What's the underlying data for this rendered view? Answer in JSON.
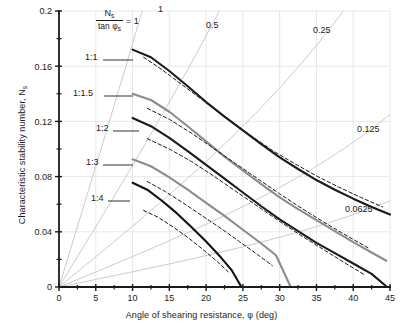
{
  "chart_data": {
    "type": "line",
    "title": "",
    "xlabel": "Angle of shearing resistance, φ (deg)",
    "ylabel": "Characteristic stability number, N",
    "ylabel_sub": "s",
    "xlim": [
      0,
      45
    ],
    "ylim": [
      0,
      0.2
    ],
    "grid": true,
    "x_ticks": [
      0,
      5,
      10,
      15,
      20,
      25,
      30,
      35,
      40,
      45
    ],
    "x_tick_labels": [
      "0",
      "5",
      "10",
      "15",
      "20",
      "25",
      "30",
      "35",
      "40",
      "45"
    ],
    "x_minor_step": 2.5,
    "y_ticks": [
      0,
      0.04,
      0.08,
      0.12,
      0.16,
      0.2
    ],
    "y_tick_labels": [
      "0",
      "0.04",
      "0.08",
      "0.12",
      "0.16",
      "0.2"
    ],
    "y_minor_step": 0.02,
    "legend_position": "inline-labels",
    "annotation_fraction": {
      "numerator": "N",
      "numerator_sub": "s",
      "denominator": "tan φ",
      "denominator_sub": "s",
      "equals": "= 1"
    },
    "rays": [
      {
        "label": "1",
        "value": 1,
        "slope_ratio": 1,
        "label_x": 158,
        "label_y": 12
      },
      {
        "label": "0.5",
        "value": 0.5,
        "slope_ratio": 0.5,
        "label_x": 206,
        "label_y": 28
      },
      {
        "label": "0.25",
        "value": 0.25,
        "slope_ratio": 0.25,
        "label_x": 313,
        "label_y": 33
      },
      {
        "label": "0.125",
        "value": 0.125,
        "slope_ratio": 0.125,
        "label_x": 357,
        "label_y": 132
      },
      {
        "label": "0.0625",
        "value": 0.0625,
        "slope_ratio": 0.0625,
        "label_x": 345,
        "label_y": 212
      }
    ],
    "series": [
      {
        "name": "1:1",
        "label": "1:1",
        "style": "solid-dark",
        "color": "#1a1a1a",
        "label_x": 85,
        "label_y": 56,
        "leader_from_x": 103,
        "leader_to_x": 133,
        "leader_y": 60,
        "points": [
          {
            "x": 10,
            "y": 0.172
          },
          {
            "x": 12.5,
            "y": 0.1665
          },
          {
            "x": 15,
            "y": 0.1565
          },
          {
            "x": 17.5,
            "y": 0.1455
          },
          {
            "x": 20,
            "y": 0.134
          },
          {
            "x": 22.5,
            "y": 0.1235
          },
          {
            "x": 25,
            "y": 0.1135
          },
          {
            "x": 27.5,
            "y": 0.1035
          },
          {
            "x": 30,
            "y": 0.094
          },
          {
            "x": 32.5,
            "y": 0.0855
          },
          {
            "x": 35,
            "y": 0.0775
          },
          {
            "x": 37.5,
            "y": 0.0705
          },
          {
            "x": 40,
            "y": 0.064
          },
          {
            "x": 42.5,
            "y": 0.058
          },
          {
            "x": 45,
            "y": 0.0525
          }
        ]
      },
      {
        "name": "1:1 dashed",
        "label": "",
        "style": "dashed-dark",
        "color": "#1a1a1a",
        "points": [
          {
            "x": 11.5,
            "y": 0.1665
          },
          {
            "x": 14,
            "y": 0.1575
          },
          {
            "x": 17,
            "y": 0.1455
          },
          {
            "x": 20,
            "y": 0.1335
          },
          {
            "x": 23,
            "y": 0.1215
          },
          {
            "x": 26,
            "y": 0.11
          },
          {
            "x": 29,
            "y": 0.099
          },
          {
            "x": 32,
            "y": 0.0895
          },
          {
            "x": 35,
            "y": 0.0805
          },
          {
            "x": 38,
            "y": 0.0725
          },
          {
            "x": 41,
            "y": 0.065
          },
          {
            "x": 44,
            "y": 0.058
          }
        ]
      },
      {
        "name": "1:1.5",
        "label": "1:1.5",
        "style": "solid-gray",
        "color": "#8c8c8c",
        "label_x": 73,
        "label_y": 92,
        "leader_from_x": 104,
        "leader_to_x": 133,
        "leader_y": 96,
        "points": [
          {
            "x": 10,
            "y": 0.14
          },
          {
            "x": 12.5,
            "y": 0.1355
          },
          {
            "x": 15,
            "y": 0.127
          },
          {
            "x": 17.5,
            "y": 0.1165
          },
          {
            "x": 20,
            "y": 0.1055
          },
          {
            "x": 22.5,
            "y": 0.0945
          },
          {
            "x": 25,
            "y": 0.0845
          },
          {
            "x": 27.5,
            "y": 0.0745
          },
          {
            "x": 30,
            "y": 0.065
          },
          {
            "x": 32.5,
            "y": 0.0565
          },
          {
            "x": 35,
            "y": 0.0485
          },
          {
            "x": 37.5,
            "y": 0.0405
          },
          {
            "x": 40,
            "y": 0.0325
          },
          {
            "x": 42.5,
            "y": 0.025
          },
          {
            "x": 44.5,
            "y": 0.019
          }
        ]
      },
      {
        "name": "1:1.5 dashed",
        "label": "",
        "style": "dashed-dark",
        "color": "#1a1a1a",
        "points": [
          {
            "x": 12,
            "y": 0.1295
          },
          {
            "x": 15,
            "y": 0.1215
          },
          {
            "x": 18,
            "y": 0.1115
          },
          {
            "x": 21,
            "y": 0.1005
          },
          {
            "x": 24,
            "y": 0.0895
          },
          {
            "x": 27,
            "y": 0.0785
          },
          {
            "x": 30,
            "y": 0.0675
          },
          {
            "x": 33,
            "y": 0.057
          },
          {
            "x": 36,
            "y": 0.047
          },
          {
            "x": 39,
            "y": 0.0375
          },
          {
            "x": 42,
            "y": 0.0285
          }
        ]
      },
      {
        "name": "1:2",
        "label": "1:2",
        "style": "solid-dark",
        "color": "#1a1a1a",
        "label_x": 96,
        "label_y": 127,
        "leader_from_x": 113,
        "leader_to_x": 139,
        "leader_y": 131,
        "points": [
          {
            "x": 10,
            "y": 0.1225
          },
          {
            "x": 12.5,
            "y": 0.1165
          },
          {
            "x": 15,
            "y": 0.108
          },
          {
            "x": 17.5,
            "y": 0.0985
          },
          {
            "x": 20,
            "y": 0.0885
          },
          {
            "x": 22.5,
            "y": 0.0785
          },
          {
            "x": 25,
            "y": 0.0685
          },
          {
            "x": 27.5,
            "y": 0.0585
          },
          {
            "x": 30,
            "y": 0.049
          },
          {
            "x": 32.5,
            "y": 0.0405
          },
          {
            "x": 35,
            "y": 0.032
          },
          {
            "x": 37.5,
            "y": 0.0245
          },
          {
            "x": 40,
            "y": 0.017
          },
          {
            "x": 42.5,
            "y": 0.0095
          },
          {
            "x": 44.6,
            "y": 0.0
          }
        ]
      },
      {
        "name": "1:2 dashed",
        "label": "",
        "style": "dashed-dark",
        "color": "#1a1a1a",
        "points": [
          {
            "x": 12,
            "y": 0.1075
          },
          {
            "x": 15,
            "y": 0.1
          },
          {
            "x": 18,
            "y": 0.091
          },
          {
            "x": 21,
            "y": 0.0805
          },
          {
            "x": 24,
            "y": 0.0695
          },
          {
            "x": 27,
            "y": 0.0585
          },
          {
            "x": 30,
            "y": 0.0475
          },
          {
            "x": 33,
            "y": 0.037
          },
          {
            "x": 36,
            "y": 0.027
          },
          {
            "x": 39,
            "y": 0.017
          },
          {
            "x": 41.5,
            "y": 0.009
          }
        ]
      },
      {
        "name": "1:3",
        "label": "1:3",
        "style": "solid-gray",
        "color": "#8c8c8c",
        "label_x": 86,
        "label_y": 161,
        "leader_from_x": 103,
        "leader_to_x": 133,
        "leader_y": 165,
        "points": [
          {
            "x": 10,
            "y": 0.0925
          },
          {
            "x": 12.5,
            "y": 0.0875
          },
          {
            "x": 15,
            "y": 0.0795
          },
          {
            "x": 17.5,
            "y": 0.0705
          },
          {
            "x": 20,
            "y": 0.061
          },
          {
            "x": 22.5,
            "y": 0.0515
          },
          {
            "x": 25,
            "y": 0.0415
          },
          {
            "x": 27.5,
            "y": 0.0315
          },
          {
            "x": 29.5,
            "y": 0.023
          },
          {
            "x": 31.5,
            "y": 0.0
          }
        ]
      },
      {
        "name": "1:3 dashed",
        "label": "",
        "style": "dashed-dark",
        "color": "#1a1a1a",
        "points": [
          {
            "x": 12,
            "y": 0.0765
          },
          {
            "x": 14.5,
            "y": 0.069
          },
          {
            "x": 17,
            "y": 0.0605
          },
          {
            "x": 19.5,
            "y": 0.0515
          },
          {
            "x": 22,
            "y": 0.0425
          },
          {
            "x": 24.5,
            "y": 0.033
          },
          {
            "x": 27,
            "y": 0.0235
          },
          {
            "x": 29,
            "y": 0.0155
          }
        ]
      },
      {
        "name": "1:4",
        "label": "1:4",
        "style": "solid-dark",
        "color": "#111111",
        "label_x": 91,
        "label_y": 197,
        "leader_from_x": 108,
        "leader_to_x": 130,
        "leader_y": 201,
        "points": [
          {
            "x": 10,
            "y": 0.0755
          },
          {
            "x": 12,
            "y": 0.0705
          },
          {
            "x": 14,
            "y": 0.0625
          },
          {
            "x": 16,
            "y": 0.0535
          },
          {
            "x": 18,
            "y": 0.0435
          },
          {
            "x": 20,
            "y": 0.033
          },
          {
            "x": 22,
            "y": 0.0215
          },
          {
            "x": 23.5,
            "y": 0.012
          },
          {
            "x": 24.8,
            "y": 0.0
          }
        ]
      },
      {
        "name": "1:4 dashed",
        "label": "",
        "style": "dashed-dark",
        "color": "#1a1a1a",
        "points": [
          {
            "x": 11.5,
            "y": 0.0555
          },
          {
            "x": 13.5,
            "y": 0.0505
          },
          {
            "x": 15.5,
            "y": 0.0435
          },
          {
            "x": 17.5,
            "y": 0.036
          },
          {
            "x": 19.5,
            "y": 0.0275
          },
          {
            "x": 21.5,
            "y": 0.0185
          },
          {
            "x": 23,
            "y": 0.011
          }
        ]
      }
    ],
    "colors": {
      "axis": "#1a1a1a",
      "grid": "#e2e2e2",
      "ray": "#c4c4c4",
      "curve_dark": "#1a1a1a",
      "curve_gray": "#8c8c8c",
      "background": "#ffffff"
    }
  }
}
